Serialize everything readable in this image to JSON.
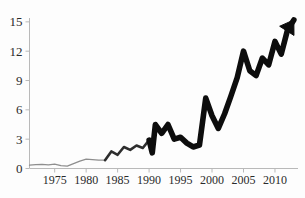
{
  "chart_data": {
    "type": "line",
    "title": "",
    "subtitle": "",
    "xlabel": "",
    "ylabel": "",
    "xlim": [
      1971,
      2013.5
    ],
    "ylim": [
      0,
      15.6
    ],
    "grid": false,
    "legend": null,
    "y_ticks": [
      0,
      3,
      6,
      9,
      12,
      15
    ],
    "y_tick_labels": [
      "0",
      "3",
      "6",
      "9",
      "12",
      "15"
    ],
    "x_ticks": [
      1975,
      1980,
      1985,
      1990,
      1995,
      2000,
      2005,
      2010
    ],
    "x_tick_labels": [
      "1975",
      "1980",
      "1985",
      "1990",
      "1995",
      "2000",
      "2005",
      "2010"
    ],
    "annotations": [
      {
        "name": "arrowhead-end-of-line",
        "text": "",
        "x": 2013.4,
        "y": 15.2
      }
    ],
    "style": {
      "line_color": "#0d0d0d",
      "early_line_color": "#8e8e8e",
      "axis_color": "#b9b9b9",
      "background": "#fdfdfd",
      "line_weight_note": "stroke thickens progressively from hairline (1971) to very heavy (2013)",
      "arrow_at_end": true
    },
    "x": [
      1971,
      1972,
      1973,
      1974,
      1975,
      1976,
      1977,
      1978,
      1979,
      1980,
      1981,
      1982,
      1983,
      1984,
      1985,
      1986,
      1987,
      1988,
      1989,
      1990,
      1990.5,
      1991,
      1992,
      1993,
      1994,
      1995,
      1996,
      1997,
      1998,
      1999,
      2000,
      2001,
      2002,
      2003,
      2004,
      2005,
      2006,
      2007,
      2008,
      2009,
      2010,
      2011,
      2012,
      2013
    ],
    "values": [
      0.35,
      0.4,
      0.42,
      0.38,
      0.45,
      0.3,
      0.25,
      0.5,
      0.75,
      0.95,
      0.9,
      0.85,
      0.85,
      1.75,
      1.4,
      2.2,
      1.9,
      2.35,
      2.1,
      2.9,
      1.6,
      4.5,
      3.6,
      4.5,
      3.0,
      3.2,
      2.6,
      2.2,
      2.4,
      7.2,
      5.4,
      4.1,
      5.6,
      7.4,
      9.3,
      12.0,
      10.0,
      9.5,
      11.3,
      10.6,
      13.0,
      11.7,
      14.2,
      15.2
    ],
    "series": [
      {
        "name": "value",
        "x": [
          1971,
          1972,
          1973,
          1974,
          1975,
          1976,
          1977,
          1978,
          1979,
          1980,
          1981,
          1982,
          1983,
          1984,
          1985,
          1986,
          1987,
          1988,
          1989,
          1990,
          1990.5,
          1991,
          1992,
          1993,
          1994,
          1995,
          1996,
          1997,
          1998,
          1999,
          2000,
          2001,
          2002,
          2003,
          2004,
          2005,
          2006,
          2007,
          2008,
          2009,
          2010,
          2011,
          2012,
          2013
        ],
        "values": [
          0.35,
          0.4,
          0.42,
          0.38,
          0.45,
          0.3,
          0.25,
          0.5,
          0.75,
          0.95,
          0.9,
          0.85,
          0.85,
          1.75,
          1.4,
          2.2,
          1.9,
          2.35,
          2.1,
          2.9,
          1.6,
          4.5,
          3.6,
          4.5,
          3.0,
          3.2,
          2.6,
          2.2,
          2.4,
          7.2,
          5.4,
          4.1,
          5.6,
          7.4,
          9.3,
          12.0,
          10.0,
          9.5,
          11.3,
          10.6,
          13.0,
          11.7,
          14.2,
          15.2
        ]
      }
    ]
  }
}
